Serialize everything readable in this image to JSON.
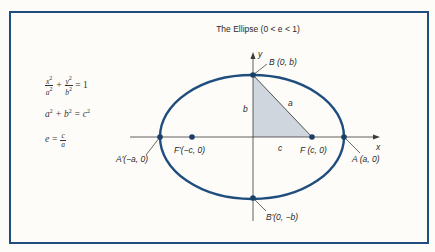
{
  "title": "The Ellipse (0 < e < 1)",
  "equations": {
    "standard_form": {
      "x_num": "x",
      "x_den": "a",
      "y_num": "y",
      "y_den": "b",
      "exp": "2",
      "rhs": "= 1"
    },
    "relation": {
      "lhs": "a",
      "plus": "+ b",
      "eq": "= c",
      "exp": "2"
    },
    "eccentricity": {
      "lhs": "e =",
      "num": "c",
      "den": "a"
    }
  },
  "axes": {
    "x_label": "x",
    "y_label": "y"
  },
  "points": {
    "B": "B (0, b)",
    "B_prime": "B′(0, −b)",
    "A": "A (a, 0)",
    "A_prime": "A′(−a, 0)",
    "F": "F (c, 0)",
    "F_prime": "F′(−c, 0)"
  },
  "segments": {
    "a": "a",
    "b": "b",
    "c": "c"
  },
  "colors": {
    "ellipse": "#1f4e7e",
    "frame": "#1f4e7e",
    "triangle_fill": "#cfd6dd",
    "axis": "#3a3a3a"
  }
}
